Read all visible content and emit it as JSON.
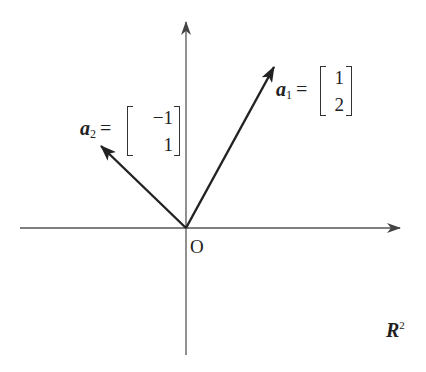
{
  "diagram": {
    "type": "vector-plane",
    "space_label": {
      "base": "R",
      "superscript": "2"
    },
    "origin_label": "O",
    "axes": {
      "x": {
        "from": [
          20,
          228
        ],
        "to": [
          400,
          228
        ]
      },
      "y": {
        "from": [
          186,
          355
        ],
        "to": [
          186,
          22
        ]
      }
    },
    "vectors": [
      {
        "name": "a",
        "subscript": "1",
        "equals": "=",
        "components": [
          "1",
          "2"
        ],
        "tip": [
          274,
          67
        ]
      },
      {
        "name": "a",
        "subscript": "2",
        "equals": "=",
        "components": [
          "−1",
          "1"
        ],
        "tip": [
          101,
          146
        ]
      }
    ],
    "colors": {
      "axis": "#555555",
      "vector": "#222222",
      "text": "#222222",
      "background": "#ffffff"
    }
  }
}
